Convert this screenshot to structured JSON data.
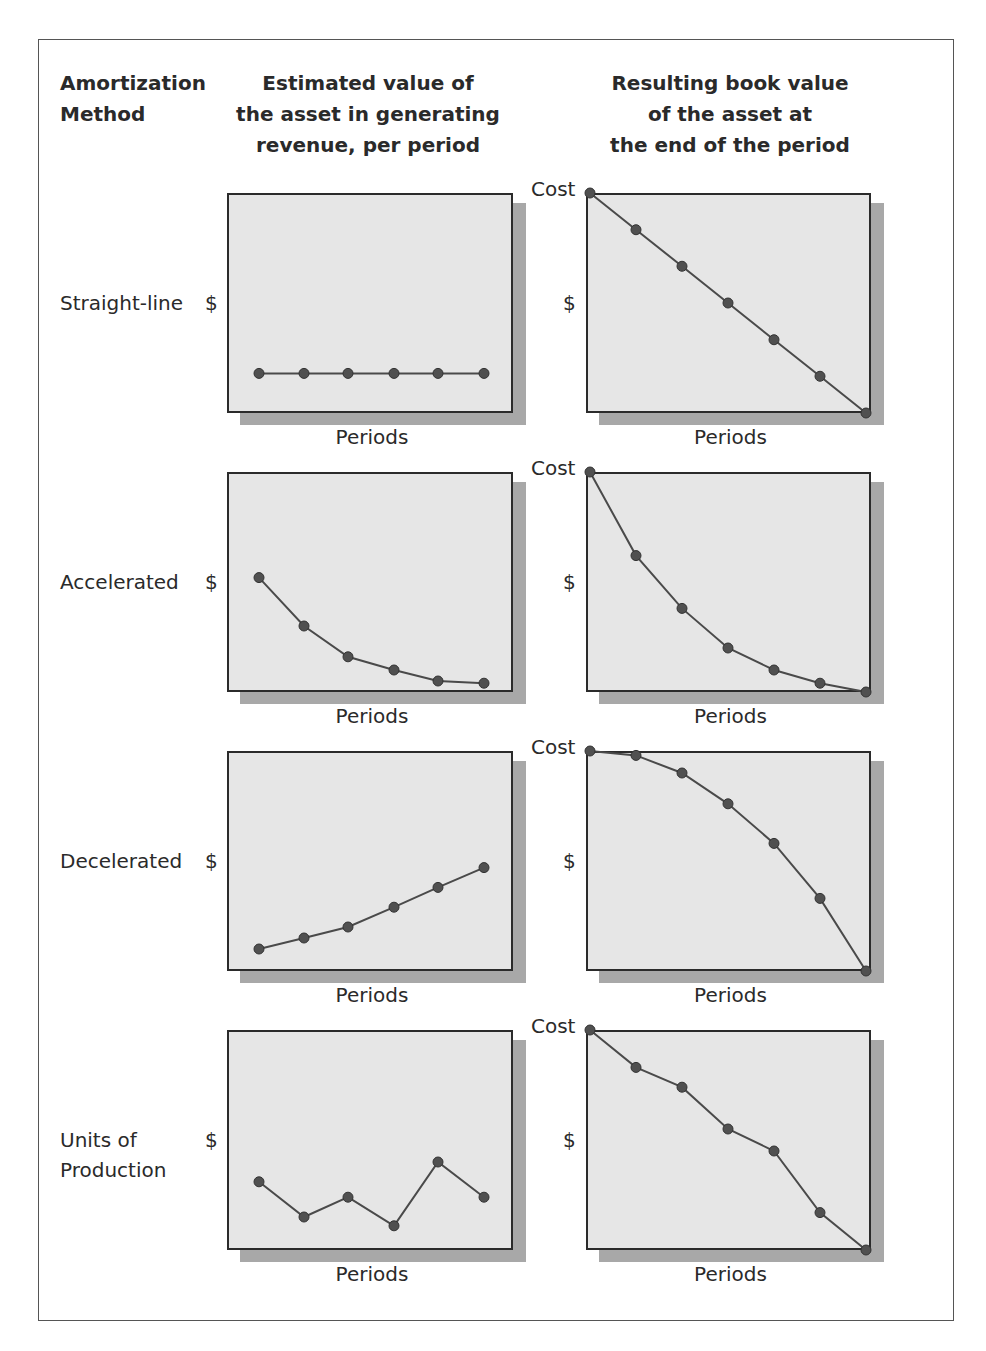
{
  "headers": {
    "method": [
      "Amortization",
      "Method"
    ],
    "left": [
      "Estimated value of",
      "the asset in generating",
      "revenue, per period"
    ],
    "right": [
      "Resulting book value",
      "of the asset at",
      "the end of the period"
    ]
  },
  "axis": {
    "y_symbol": "$",
    "x_label": "Periods",
    "cost_label": "Cost"
  },
  "rows": [
    {
      "label": [
        "Straight-line"
      ]
    },
    {
      "label": [
        "Accelerated"
      ]
    },
    {
      "label": [
        "Decelerated"
      ]
    },
    {
      "label": [
        "Units of",
        "Production"
      ]
    }
  ],
  "colors": {
    "plot_bg": "#e6e6e6",
    "shadow": "#a8a8a8",
    "line": "#4a4a4a",
    "dot": "#505050"
  },
  "chart_data": [
    {
      "type": "line",
      "title": "Straight-line: Estimated value per period",
      "xlabel": "Periods",
      "ylabel": "$",
      "x": [
        1,
        2,
        3,
        4,
        5,
        6
      ],
      "values": [
        18,
        18,
        18,
        18,
        18,
        18
      ],
      "ylim": [
        0,
        100
      ],
      "grid": false
    },
    {
      "type": "line",
      "title": "Straight-line: Book value at end of period",
      "xlabel": "Periods",
      "ylabel": "$",
      "y_top_label": "Cost",
      "x": [
        0,
        1,
        2,
        3,
        4,
        5,
        6
      ],
      "values": [
        100,
        83.3,
        66.7,
        50,
        33.3,
        16.7,
        0
      ],
      "ylim": [
        0,
        100
      ],
      "grid": false
    },
    {
      "type": "line",
      "title": "Accelerated: Estimated value per period",
      "xlabel": "Periods",
      "ylabel": "$",
      "x": [
        1,
        2,
        3,
        4,
        5,
        6
      ],
      "values": [
        52,
        30,
        16,
        10,
        5,
        4
      ],
      "ylim": [
        0,
        100
      ],
      "grid": false
    },
    {
      "type": "line",
      "title": "Accelerated: Book value at end of period",
      "xlabel": "Periods",
      "ylabel": "$",
      "y_top_label": "Cost",
      "x": [
        0,
        1,
        2,
        3,
        4,
        5,
        6
      ],
      "values": [
        100,
        62,
        38,
        20,
        10,
        4,
        0
      ],
      "ylim": [
        0,
        100
      ],
      "grid": false
    },
    {
      "type": "line",
      "title": "Decelerated: Estimated value per period",
      "xlabel": "Periods",
      "ylabel": "$",
      "x": [
        1,
        2,
        3,
        4,
        5,
        6
      ],
      "values": [
        10,
        15,
        20,
        29,
        38,
        47
      ],
      "ylim": [
        0,
        100
      ],
      "grid": false
    },
    {
      "type": "line",
      "title": "Decelerated: Book value at end of period",
      "xlabel": "Periods",
      "ylabel": "$",
      "y_top_label": "Cost",
      "x": [
        0,
        1,
        2,
        3,
        4,
        5,
        6
      ],
      "values": [
        100,
        98,
        90,
        76,
        58,
        33,
        0
      ],
      "ylim": [
        0,
        100
      ],
      "grid": false
    },
    {
      "type": "line",
      "title": "Units of Production: Estimated value per period",
      "xlabel": "Periods",
      "ylabel": "$",
      "x": [
        1,
        2,
        3,
        4,
        5,
        6
      ],
      "values": [
        31,
        15,
        24,
        11,
        40,
        24
      ],
      "ylim": [
        0,
        100
      ],
      "grid": false
    },
    {
      "type": "line",
      "title": "Units of Production: Book value at end of period",
      "xlabel": "Periods",
      "ylabel": "$",
      "y_top_label": "Cost",
      "x": [
        0,
        1,
        2,
        3,
        4,
        5,
        6
      ],
      "values": [
        100,
        83,
        74,
        55,
        45,
        17,
        0
      ],
      "ylim": [
        0,
        100
      ],
      "grid": false
    }
  ]
}
